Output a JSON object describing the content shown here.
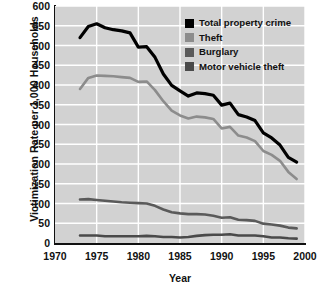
{
  "chart_data": {
    "type": "line",
    "title": "",
    "xlabel": "Year",
    "ylabel": "Victimization Rate per 1,000 Households",
    "xlim": [
      1970,
      2000
    ],
    "ylim": [
      0,
      600
    ],
    "xticks": [
      1970,
      1975,
      1980,
      1985,
      1990,
      1995,
      2000
    ],
    "yticks": [
      0,
      50,
      100,
      150,
      200,
      250,
      300,
      350,
      400,
      450,
      500,
      550,
      600
    ],
    "grid": true,
    "grid_color": "#ffffff",
    "plot_background": "#d2d2d2",
    "legend_position": "top-right",
    "x": [
      1973,
      1974,
      1975,
      1976,
      1977,
      1978,
      1979,
      1980,
      1981,
      1982,
      1983,
      1984,
      1985,
      1986,
      1987,
      1988,
      1989,
      1990,
      1991,
      1992,
      1993,
      1994,
      1995,
      1996,
      1997,
      1998,
      1999
    ],
    "series": [
      {
        "name": "Total property crime",
        "color": "#000000",
        "values": [
          520,
          548,
          555,
          545,
          540,
          537,
          532,
          496,
          497,
          470,
          428,
          399,
          385,
          372,
          380,
          378,
          374,
          349,
          354,
          325,
          319,
          310,
          279,
          266,
          248,
          217,
          205
        ]
      },
      {
        "name": "Theft",
        "color": "#8c8c8c",
        "values": [
          390,
          418,
          424,
          423,
          422,
          420,
          418,
          408,
          409,
          387,
          359,
          335,
          323,
          315,
          320,
          318,
          314,
          290,
          294,
          272,
          267,
          258,
          233,
          223,
          208,
          180,
          162
        ]
      },
      {
        "name": "Burglary",
        "color": "#5a5a5a",
        "values": [
          110,
          111,
          109,
          107,
          105,
          103,
          102,
          101,
          100,
          94,
          85,
          78,
          75,
          73,
          73,
          72,
          69,
          64,
          65,
          59,
          58,
          56,
          49,
          47,
          44,
          39,
          37
        ]
      },
      {
        "name": "Motor vehicle theft",
        "color": "#4a4a4a",
        "values": [
          19,
          19,
          19,
          17,
          17,
          17,
          17,
          17,
          18,
          17,
          15,
          15,
          14,
          15,
          18,
          20,
          21,
          21,
          22,
          19,
          19,
          19,
          17,
          14,
          14,
          12,
          11
        ]
      }
    ]
  },
  "legend": {
    "items": [
      {
        "label": "Total property crime",
        "color": "#000000"
      },
      {
        "label": "Theft",
        "color": "#8c8c8c"
      },
      {
        "label": "Burglary",
        "color": "#5a5a5a"
      },
      {
        "label": "Motor vehicle theft",
        "color": "#4a4a4a"
      }
    ]
  },
  "caption": ""
}
